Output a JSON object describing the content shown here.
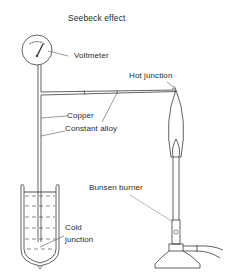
{
  "diagram": {
    "title": "Seebeck effect",
    "labels": {
      "voltmeter": "Voltmeter",
      "hot_junction": "Hot junction",
      "copper": "Copper",
      "constant_alloy": "Constant alloy",
      "bunsen_burner": "Bunsen burner",
      "cold_junction_line1": "Cold",
      "cold_junction_line2": "junction"
    },
    "colors": {
      "line": "#3a3a3a",
      "leader": "#555555",
      "background": "#ffffff"
    }
  }
}
